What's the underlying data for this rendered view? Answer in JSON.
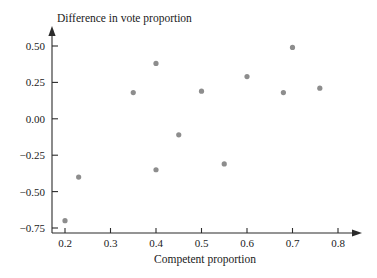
{
  "chart_data": {
    "type": "scatter",
    "title": "",
    "xlabel": "Competent proportion",
    "ylabel": "Difference in vote proportion",
    "xlim": [
      0.155,
      0.845
    ],
    "ylim": [
      -0.8,
      0.58
    ],
    "grid": false,
    "legend": null,
    "marker": {
      "shape": "circle",
      "color": "#8d8d8d",
      "radius_px": 2.6
    },
    "xticks": [
      0.2,
      0.3,
      0.4,
      0.5,
      0.6,
      0.7,
      0.8
    ],
    "xtick_labels": [
      "0.2",
      "0.3",
      "0.4",
      "0.5",
      "0.6",
      "0.7",
      "0.8"
    ],
    "yticks": [
      0.5,
      0.25,
      0.0,
      -0.25,
      -0.5,
      -0.75
    ],
    "ytick_labels": [
      "0.50",
      "0.25",
      "0.00",
      "−0.25",
      "−0.50",
      "−0.75"
    ],
    "x": [
      0.2,
      0.23,
      0.35,
      0.4,
      0.4,
      0.45,
      0.5,
      0.55,
      0.6,
      0.68,
      0.7,
      0.76
    ],
    "y": [
      -0.7,
      -0.4,
      0.18,
      0.38,
      -0.35,
      -0.11,
      0.19,
      -0.31,
      0.29,
      0.18,
      0.49,
      0.21
    ],
    "points": [
      {
        "x": 0.2,
        "y": -0.7
      },
      {
        "x": 0.23,
        "y": -0.4
      },
      {
        "x": 0.35,
        "y": 0.18
      },
      {
        "x": 0.4,
        "y": 0.38
      },
      {
        "x": 0.4,
        "y": -0.35
      },
      {
        "x": 0.45,
        "y": -0.11
      },
      {
        "x": 0.5,
        "y": 0.19
      },
      {
        "x": 0.55,
        "y": -0.31
      },
      {
        "x": 0.6,
        "y": 0.29
      },
      {
        "x": 0.68,
        "y": 0.18
      },
      {
        "x": 0.7,
        "y": 0.49
      },
      {
        "x": 0.76,
        "y": 0.21
      }
    ],
    "axis_colors": {
      "axis": "#2b2b2b",
      "text": "#1a1a1a",
      "background": "#ffffff"
    }
  }
}
